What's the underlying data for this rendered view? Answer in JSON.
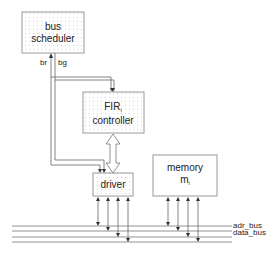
{
  "diagram": {
    "colors": {
      "line": "#555555",
      "box_border": "#9a9a9a",
      "box_dots": "#d4d4d4",
      "text": "#222222"
    },
    "blocks": {
      "bus_scheduler": {
        "line1": "bus",
        "line2": "scheduler"
      },
      "fir_controller": {
        "line1": "FIR",
        "line1_sub": "i",
        "line2": "controller"
      },
      "driver": {
        "label": "driver"
      },
      "memory": {
        "line1": "memory",
        "line2": "m",
        "line2_sub": "i"
      }
    },
    "signals": {
      "br": "br",
      "bg": "bg"
    },
    "buses": {
      "adr_bus": "adr_bus",
      "data_bus": "data_bus"
    }
  }
}
